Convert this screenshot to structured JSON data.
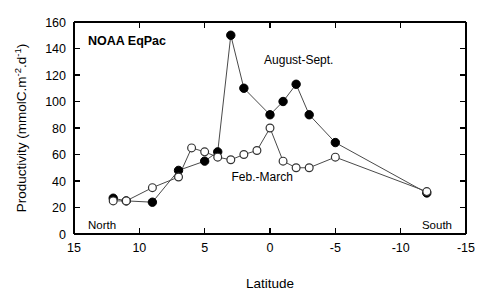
{
  "chart_data": {
    "type": "line",
    "title": "NOAA  EqPac",
    "xlabel": "Latitude",
    "ylabel": "Productivity (mmolC.m-2.d-1)",
    "ylabel_parts": {
      "prefix": "Productivity (mmolC.m",
      "sup1": "-2",
      "mid": ".d",
      "sup2": "-1",
      "suffix": ")"
    },
    "xlim": [
      15,
      -15
    ],
    "ylim": [
      0,
      160
    ],
    "xticks": [
      15,
      10,
      5,
      0,
      -5,
      -10,
      -15
    ],
    "xtick_labels": [
      "15",
      "10",
      "5",
      "0",
      "-5",
      "-10",
      "-15"
    ],
    "yticks": [
      0,
      20,
      40,
      60,
      80,
      100,
      120,
      140,
      160
    ],
    "ytick_labels": [
      "0",
      "20",
      "40",
      "60",
      "80",
      "100",
      "120",
      "140",
      "160"
    ],
    "grid": false,
    "legend_position": "inline-annotations",
    "axis_direction_note": "x-axis reversed: north (positive latitude) at left, south (negative latitude) at right",
    "pole_labels": {
      "left": "North",
      "right": "South"
    },
    "annotations": [
      {
        "text": "August-Sept.",
        "x": -2.2,
        "y": 128
      },
      {
        "text": "Feb.-March",
        "x": 0.6,
        "y": 40
      }
    ],
    "series": [
      {
        "name": "August-Sept.",
        "marker": "filled-circle",
        "color": "#000000",
        "x": [
          12,
          11,
          9,
          7,
          5,
          4,
          3,
          2,
          0,
          -1,
          -2,
          -3,
          -5,
          -12
        ],
        "values": [
          27,
          25,
          24,
          48,
          55,
          62,
          150,
          110,
          90,
          100,
          113,
          90,
          69,
          31
        ]
      },
      {
        "name": "Feb.-March",
        "marker": "open-circle",
        "color": "#333333",
        "x": [
          12,
          11,
          9,
          7,
          6,
          5,
          4,
          3,
          2,
          1,
          0,
          -1,
          -2,
          -3,
          -5,
          -12
        ],
        "values": [
          25,
          25,
          35,
          43,
          65,
          62,
          58,
          56,
          60,
          63,
          80,
          55,
          50,
          50,
          58,
          32
        ]
      }
    ]
  }
}
